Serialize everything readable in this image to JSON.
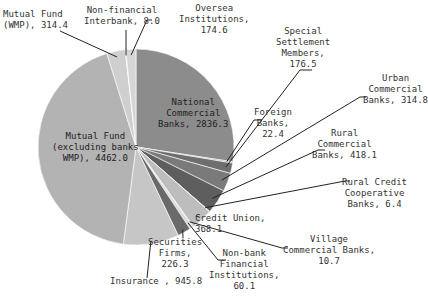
{
  "chart_data": {
    "type": "pie",
    "title": "",
    "unit": "",
    "start_angle_deg": 0,
    "direction": "clockwise",
    "categories": [
      "National Commercial Banks",
      "Foreign Banks",
      "Special Settlement Members",
      "Urban Commercial Banks",
      "Rural Commercial Banks",
      "Rural Credit Cooperative Banks",
      "Credit Union",
      "Village Commercial Banks",
      "Non-bank Financial Institutions",
      "Securities Firms",
      "Insurance",
      "Mutual Fund (excluding banks WMP)",
      "Mutual Fund (WMP)",
      "Non-financial Interbank",
      "Oversea Institutions"
    ],
    "values": [
      2836.3,
      22.4,
      176.5,
      314.8,
      418.1,
      6.4,
      368.1,
      10.7,
      60.1,
      226.3,
      945.8,
      4462.0,
      314.4,
      8.0,
      174.6
    ],
    "colors": [
      "#8c8c8c",
      "#a0a0a0",
      "#6e6e6e",
      "#7a7a7a",
      "#5e5e5e",
      "#9a9a9a",
      "#bdbdbd",
      "#888888",
      "#dadada",
      "#6a6a6a",
      "#c6c6c6",
      "#b3b3b3",
      "#cfcfcf",
      "#e2e2e2",
      "#d6d6d6"
    ],
    "legend": "none",
    "data_labels": true
  },
  "labels": [
    {
      "id": "national",
      "text": "National\nCommercial\nBanks, 2836.3"
    },
    {
      "id": "foreign",
      "text": "Foreign\nBanks,\n22.4"
    },
    {
      "id": "special",
      "text": "Special\nSettlement\nMembers,\n176.5"
    },
    {
      "id": "urban",
      "text": "Urban\nCommercial\nBanks, 314.8"
    },
    {
      "id": "rural_comm",
      "text": "Rural\nCommercial\nBanks, 418.1"
    },
    {
      "id": "rural_credit",
      "text": "Rural Credit\nCooperative\nBanks, 6.4"
    },
    {
      "id": "credit_union",
      "text": "Credit Union,\n368.1"
    },
    {
      "id": "village",
      "text": "Village\nCommercial Banks,\n10.7"
    },
    {
      "id": "nonbank",
      "text": "Non-bank\nFinancial\nInstitutions,\n60.1"
    },
    {
      "id": "securities",
      "text": "Securities\nFirms,\n226.3"
    },
    {
      "id": "insurance",
      "text": "Insurance , 945.8"
    },
    {
      "id": "mf_ex",
      "text": "Mutual Fund\n(excluding banks\nWMP), 4462.0"
    },
    {
      "id": "mf_wmp",
      "text": "Mutual Fund\n(WMP), 314.4"
    },
    {
      "id": "nonfin",
      "text": "Non-financial\nInterbank, 8.0"
    },
    {
      "id": "oversea",
      "text": "Oversea\nInstitutions,\n174.6"
    }
  ]
}
